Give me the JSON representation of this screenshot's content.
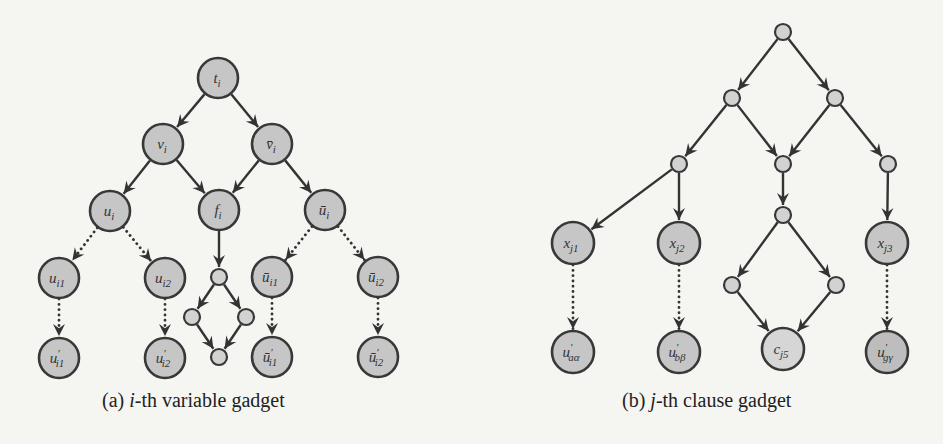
{
  "figure": {
    "panels": [
      {
        "id": "a",
        "caption": {
          "prefix": "(a) ",
          "var": "i",
          "rest": "-th variable gadget"
        },
        "caption_x": 102,
        "nodes": [
          {
            "id": "t_i",
            "x": 218,
            "y": 78,
            "r": 20,
            "size": "big",
            "label": "t",
            "sub": "i",
            "accent": ""
          },
          {
            "id": "v_i",
            "x": 163,
            "y": 144,
            "r": 20,
            "size": "big",
            "label": "v",
            "sub": "i",
            "accent": ""
          },
          {
            "id": "vbar_i",
            "x": 272,
            "y": 144,
            "r": 20,
            "size": "big",
            "label": "v",
            "sub": "i",
            "accent": "bar"
          },
          {
            "id": "u_i",
            "x": 110,
            "y": 211,
            "r": 20,
            "size": "big",
            "label": "u",
            "sub": "i",
            "accent": ""
          },
          {
            "id": "f_i",
            "x": 219,
            "y": 210,
            "r": 20,
            "size": "big",
            "label": "f",
            "sub": "i",
            "accent": ""
          },
          {
            "id": "ubar_i",
            "x": 325,
            "y": 210,
            "r": 20,
            "size": "big",
            "label": "u",
            "sub": "i",
            "accent": "bar"
          },
          {
            "id": "u_i1",
            "x": 59,
            "y": 278,
            "r": 20,
            "size": "big",
            "label": "u",
            "sub": "i1",
            "accent": ""
          },
          {
            "id": "u_i2",
            "x": 165,
            "y": 278,
            "r": 20,
            "size": "big",
            "label": "u",
            "sub": "i2",
            "accent": ""
          },
          {
            "id": "s_top",
            "x": 219,
            "y": 277,
            "r": 8,
            "size": "small",
            "label": "",
            "sub": "",
            "accent": ""
          },
          {
            "id": "s_left",
            "x": 192,
            "y": 317,
            "r": 8,
            "size": "small",
            "label": "",
            "sub": "",
            "accent": ""
          },
          {
            "id": "s_right",
            "x": 246,
            "y": 317,
            "r": 8,
            "size": "small",
            "label": "",
            "sub": "",
            "accent": ""
          },
          {
            "id": "s_bottom",
            "x": 219,
            "y": 357,
            "r": 8,
            "size": "small",
            "label": "",
            "sub": "",
            "accent": ""
          },
          {
            "id": "ubar_i1",
            "x": 272,
            "y": 277,
            "r": 20,
            "size": "big",
            "label": "u",
            "sub": "i1",
            "accent": "bar"
          },
          {
            "id": "ubar_i2",
            "x": 378,
            "y": 277,
            "r": 20,
            "size": "big",
            "label": "u",
            "sub": "i2",
            "accent": "bar"
          },
          {
            "id": "up_i1",
            "x": 59,
            "y": 358,
            "r": 20,
            "size": "big",
            "label": "u",
            "sub": "i1",
            "accent": "prime"
          },
          {
            "id": "up_i2",
            "x": 165,
            "y": 358,
            "r": 20,
            "size": "big",
            "label": "u",
            "sub": "i2",
            "accent": "prime"
          },
          {
            "id": "ubarp_i1",
            "x": 272,
            "y": 357,
            "r": 20,
            "size": "big",
            "label": "u",
            "sub": "i1",
            "accent": "barprime"
          },
          {
            "id": "ubarp_i2",
            "x": 378,
            "y": 357,
            "r": 20,
            "size": "big",
            "label": "u",
            "sub": "i2",
            "accent": "barprime"
          }
        ],
        "edges": [
          {
            "from": "t_i",
            "to": "v_i",
            "style": "solid"
          },
          {
            "from": "t_i",
            "to": "vbar_i",
            "style": "solid"
          },
          {
            "from": "v_i",
            "to": "u_i",
            "style": "solid"
          },
          {
            "from": "v_i",
            "to": "f_i",
            "style": "solid"
          },
          {
            "from": "vbar_i",
            "to": "f_i",
            "style": "solid"
          },
          {
            "from": "vbar_i",
            "to": "ubar_i",
            "style": "solid"
          },
          {
            "from": "u_i",
            "to": "u_i1",
            "style": "dotted"
          },
          {
            "from": "u_i",
            "to": "u_i2",
            "style": "dotted"
          },
          {
            "from": "ubar_i",
            "to": "ubar_i1",
            "style": "dotted"
          },
          {
            "from": "ubar_i",
            "to": "ubar_i2",
            "style": "dotted"
          },
          {
            "from": "u_i1",
            "to": "up_i1",
            "style": "dotted"
          },
          {
            "from": "u_i2",
            "to": "up_i2",
            "style": "dotted"
          },
          {
            "from": "ubar_i1",
            "to": "ubarp_i1",
            "style": "dotted"
          },
          {
            "from": "ubar_i2",
            "to": "ubarp_i2",
            "style": "dotted"
          },
          {
            "from": "f_i",
            "to": "s_top",
            "style": "solid"
          },
          {
            "from": "s_top",
            "to": "s_left",
            "style": "solid"
          },
          {
            "from": "s_top",
            "to": "s_right",
            "style": "solid"
          },
          {
            "from": "s_left",
            "to": "s_bottom",
            "style": "solid"
          },
          {
            "from": "s_right",
            "to": "s_bottom",
            "style": "solid"
          }
        ]
      },
      {
        "id": "b",
        "caption": {
          "prefix": "(b) ",
          "var": "j",
          "rest": "-th clause gadget"
        },
        "caption_x": 622,
        "nodes": [
          {
            "id": "r0",
            "x": 783,
            "y": 32,
            "r": 8,
            "size": "small",
            "label": "",
            "sub": "",
            "accent": ""
          },
          {
            "id": "r1l",
            "x": 732,
            "y": 98,
            "r": 8,
            "size": "small",
            "label": "",
            "sub": "",
            "accent": ""
          },
          {
            "id": "r1r",
            "x": 835,
            "y": 98,
            "r": 8,
            "size": "small",
            "label": "",
            "sub": "",
            "accent": ""
          },
          {
            "id": "r2l",
            "x": 679,
            "y": 164,
            "r": 8,
            "size": "small",
            "label": "",
            "sub": "",
            "accent": ""
          },
          {
            "id": "r2m",
            "x": 783,
            "y": 164,
            "r": 8,
            "size": "small",
            "label": "",
            "sub": "",
            "accent": ""
          },
          {
            "id": "r2r",
            "x": 888,
            "y": 164,
            "r": 8,
            "size": "small",
            "label": "",
            "sub": "",
            "accent": ""
          },
          {
            "id": "r3m",
            "x": 783,
            "y": 215,
            "r": 8,
            "size": "small",
            "label": "",
            "sub": "",
            "accent": ""
          },
          {
            "id": "x_j1",
            "x": 573,
            "y": 243,
            "r": 21,
            "size": "big",
            "label": "x",
            "sub": "j1",
            "accent": ""
          },
          {
            "id": "x_j2",
            "x": 679,
            "y": 243,
            "r": 21,
            "size": "big",
            "label": "x",
            "sub": "j2",
            "accent": ""
          },
          {
            "id": "x_j3",
            "x": 887,
            "y": 243,
            "r": 21,
            "size": "big",
            "label": "x",
            "sub": "j3",
            "accent": ""
          },
          {
            "id": "d_left",
            "x": 732,
            "y": 285,
            "r": 8,
            "size": "small",
            "label": "",
            "sub": "",
            "accent": ""
          },
          {
            "id": "d_right",
            "x": 836,
            "y": 285,
            "r": 8,
            "size": "small",
            "label": "",
            "sub": "",
            "accent": ""
          },
          {
            "id": "c_j5",
            "x": 783,
            "y": 349,
            "r": 21,
            "size": "big",
            "label": "c",
            "sub": "j5",
            "accent": "",
            "fill": "#d6d6d6"
          },
          {
            "id": "up_aa",
            "x": 573,
            "y": 352,
            "r": 21,
            "size": "big",
            "label": "u",
            "sub": "aα",
            "accent": "prime"
          },
          {
            "id": "up_bb",
            "x": 679,
            "y": 352,
            "r": 21,
            "size": "big",
            "label": "u",
            "sub": "bβ",
            "accent": "prime"
          },
          {
            "id": "up_gg",
            "x": 887,
            "y": 352,
            "r": 21,
            "size": "big",
            "label": "u",
            "sub": "gγ",
            "accent": "prime",
            "fill": "#bdbdbd"
          }
        ],
        "edges": [
          {
            "from": "r0",
            "to": "r1l",
            "style": "solid"
          },
          {
            "from": "r0",
            "to": "r1r",
            "style": "solid"
          },
          {
            "from": "r1l",
            "to": "r2l",
            "style": "solid"
          },
          {
            "from": "r1l",
            "to": "r2m",
            "style": "solid"
          },
          {
            "from": "r1r",
            "to": "r2m",
            "style": "solid"
          },
          {
            "from": "r1r",
            "to": "r2r",
            "style": "solid"
          },
          {
            "from": "r2l",
            "to": "x_j1",
            "style": "solid"
          },
          {
            "from": "r2l",
            "to": "x_j2",
            "style": "solid"
          },
          {
            "from": "r2m",
            "to": "r3m",
            "style": "solid"
          },
          {
            "from": "r2r",
            "to": "x_j3",
            "style": "solid"
          },
          {
            "from": "r3m",
            "to": "d_left",
            "style": "solid"
          },
          {
            "from": "r3m",
            "to": "d_right",
            "style": "solid"
          },
          {
            "from": "d_left",
            "to": "c_j5",
            "style": "solid"
          },
          {
            "from": "d_right",
            "to": "c_j5",
            "style": "solid"
          },
          {
            "from": "x_j1",
            "to": "up_aa",
            "style": "dotted"
          },
          {
            "from": "x_j2",
            "to": "up_bb",
            "style": "dotted"
          },
          {
            "from": "x_j3",
            "to": "up_gg",
            "style": "dotted"
          }
        ]
      }
    ]
  },
  "colors": {
    "background": "#f5f5f2",
    "node_fill": "#c6c6c6",
    "small_node_fill": "#d2d2d2",
    "stroke": "#383838",
    "text": "#222222"
  }
}
